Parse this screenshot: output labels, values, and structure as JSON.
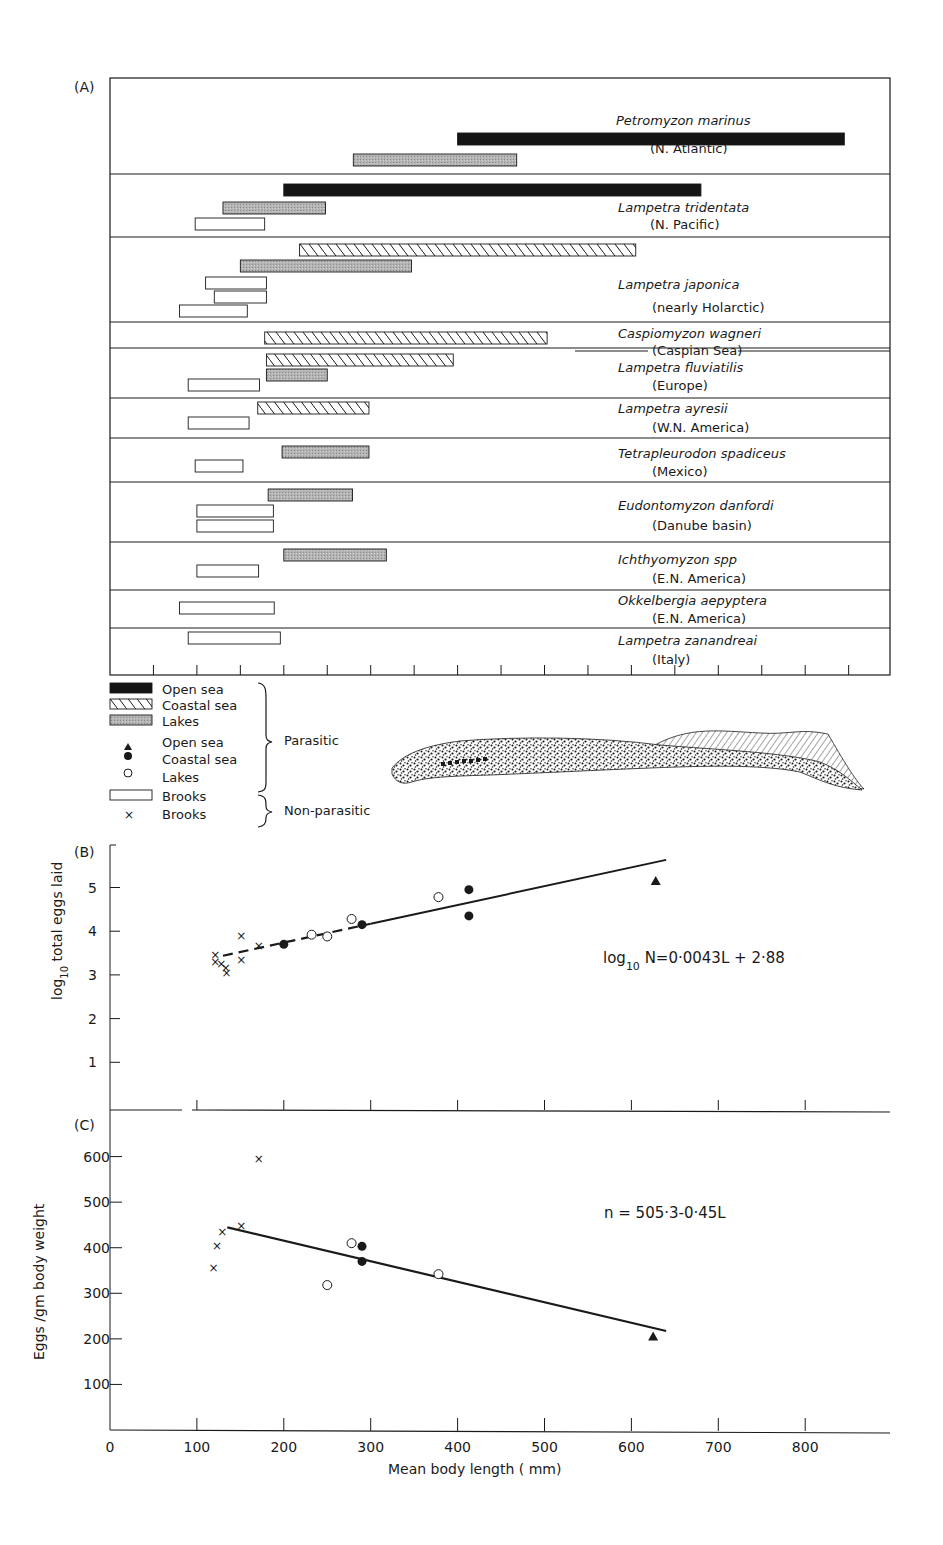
{
  "panel_a": {
    "label": "(A)",
    "species": [
      {
        "name": "Petromyzon marinus",
        "region": "(N. Atlantic)",
        "bars": [
          {
            "type": "open_sea",
            "min": 400,
            "max": 845
          },
          {
            "type": "lakes",
            "min": 280,
            "max": 468
          }
        ]
      },
      {
        "name": "Lampetra tridentata",
        "region": "(N. Pacific)",
        "bars": [
          {
            "type": "open_sea",
            "min": 200,
            "max": 680
          },
          {
            "type": "lakes",
            "min": 130,
            "max": 248
          },
          {
            "type": "brooks",
            "min": 98,
            "max": 178
          }
        ]
      },
      {
        "name": "Lampetra japonica",
        "region": "(nearly Holarctic)",
        "bars": [
          {
            "type": "coastal_sea",
            "min": 218,
            "max": 605
          },
          {
            "type": "lakes",
            "min": 150,
            "max": 347
          },
          {
            "type": "brooks",
            "min": 110,
            "max": 180
          },
          {
            "type": "brooks",
            "min": 120,
            "max": 180
          },
          {
            "type": "brooks",
            "min": 80,
            "max": 158
          }
        ]
      },
      {
        "name": "Caspiomyzon wagneri",
        "region": "(Caspian Sea)",
        "bars": [
          {
            "type": "coastal_sea",
            "min": 178,
            "max": 503
          }
        ]
      },
      {
        "name": "Lampetra fluviatilis",
        "region": "(Europe)",
        "bars": [
          {
            "type": "coastal_sea",
            "min": 180,
            "max": 395
          },
          {
            "type": "lakes",
            "min": 180,
            "max": 250
          },
          {
            "type": "brooks",
            "min": 90,
            "max": 172
          }
        ]
      },
      {
        "name": "Lampetra ayresii",
        "region": "(W.N. America)",
        "bars": [
          {
            "type": "coastal_sea",
            "min": 170,
            "max": 298
          },
          {
            "type": "brooks",
            "min": 90,
            "max": 160
          }
        ]
      },
      {
        "name": "Tetrapleurodon spadiceus",
        "region": "(Mexico)",
        "bars": [
          {
            "type": "lakes",
            "min": 198,
            "max": 298
          },
          {
            "type": "brooks",
            "min": 98,
            "max": 153
          }
        ]
      },
      {
        "name": "Eudontomyzon danfordi",
        "region": "(Danube basin)",
        "bars": [
          {
            "type": "lakes",
            "min": 182,
            "max": 279
          },
          {
            "type": "brooks",
            "min": 100,
            "max": 188
          },
          {
            "type": "brooks",
            "min": 100,
            "max": 188
          }
        ]
      },
      {
        "name": "Ichthyomyzon spp",
        "region": "(E.N. America)",
        "bars": [
          {
            "type": "lakes",
            "min": 200,
            "max": 318
          },
          {
            "type": "brooks",
            "min": 100,
            "max": 171
          }
        ]
      },
      {
        "name": "Okkelbergia aepyptera",
        "region": "(E.N. America)",
        "bars": [
          {
            "type": "brooks",
            "min": 80,
            "max": 189
          }
        ]
      },
      {
        "name": "Lampetra zanandreai",
        "region": "(Italy)",
        "bars": [
          {
            "type": "brooks",
            "min": 90,
            "max": 196
          }
        ]
      }
    ]
  },
  "legend": {
    "items": [
      {
        "symbol": "bar-open-sea",
        "label": "Open sea"
      },
      {
        "symbol": "bar-coastal-sea",
        "label": "Coastal sea"
      },
      {
        "symbol": "bar-lakes",
        "label": "Lakes"
      },
      {
        "symbol": "triangle",
        "label": "Open sea"
      },
      {
        "symbol": "filled-circle",
        "label": "Coastal sea"
      },
      {
        "symbol": "open-circle",
        "label": "Lakes"
      },
      {
        "symbol": "bar-brooks",
        "label": "Brooks"
      },
      {
        "symbol": "cross",
        "label": "Brooks"
      }
    ],
    "group_parasitic": "Parasitic",
    "group_non_parasitic": "Non-parasitic"
  },
  "colors": {
    "ink": "#1a1a1a",
    "lakes_fill": "#a8a8a8",
    "open_sea_fill": "#141414"
  },
  "chart_data": [
    {
      "type": "bar",
      "title": "(A)",
      "subtype": "horizontal range bars (body length ranges by habitat)",
      "xlabel": "Mean body length (mm)",
      "xlim": [
        0,
        900
      ],
      "x_tick_interval": 50,
      "categories": [
        "Petromyzon marinus",
        "Lampetra tridentata",
        "Lampetra japonica",
        "Caspiomyzon wagneri",
        "Lampetra fluviatilis",
        "Lampetra ayresii",
        "Tetrapleurodon spadiceus",
        "Eudontomyzon danfordi",
        "Ichthyomyzon spp",
        "Okkelbergia aepyptera",
        "Lampetra zanandreai"
      ],
      "legend": [
        "Open sea",
        "Coastal sea",
        "Lakes",
        "Brooks"
      ]
    },
    {
      "type": "scatter",
      "title": "(B)",
      "xlabel": "Mean body length (mm)",
      "ylabel": "log10 total eggs laid",
      "xlim": [
        0,
        900
      ],
      "ylim": [
        0,
        5.6
      ],
      "yticks": [
        1,
        2,
        3,
        4,
        5
      ],
      "annotation": "log10 N=0·0043L + 2·88",
      "fit_line": {
        "slope": 0.0043,
        "intercept": 2.88,
        "x_range": [
          130,
          640
        ]
      },
      "series": [
        {
          "name": "Brooks (non-parasitic)",
          "marker": "x",
          "points": [
            [
              120,
              3.45
            ],
            [
              120,
              3.3
            ],
            [
              127,
              3.25
            ],
            [
              132,
              3.15
            ],
            [
              133,
              3.05
            ],
            [
              150,
              3.9
            ],
            [
              150,
              3.35
            ],
            [
              170,
              3.65
            ]
          ]
        },
        {
          "name": "Coastal sea",
          "marker": "filled-circle",
          "points": [
            [
              200,
              3.7
            ],
            [
              290,
              4.15
            ],
            [
              413,
              4.95
            ],
            [
              413,
              4.35
            ]
          ]
        },
        {
          "name": "Lakes",
          "marker": "open-circle",
          "points": [
            [
              232,
              3.92
            ],
            [
              250,
              3.88
            ],
            [
              278,
              4.28
            ],
            [
              378,
              4.78
            ]
          ]
        },
        {
          "name": "Open sea",
          "marker": "triangle",
          "points": [
            [
              628,
              5.15
            ]
          ]
        }
      ]
    },
    {
      "type": "scatter",
      "title": "(C)",
      "xlabel": "Mean body length (mm)",
      "ylabel": "Eggs /gm body weight",
      "xlim": [
        0,
        900
      ],
      "ylim": [
        0,
        650
      ],
      "xticks": [
        0,
        100,
        200,
        300,
        400,
        500,
        600,
        700,
        800
      ],
      "yticks": [
        100,
        200,
        300,
        400,
        500,
        600
      ],
      "annotation": "n = 505·3-0·45L",
      "fit_line": {
        "slope": -0.45,
        "intercept": 505.3,
        "x_range": [
          135,
          640
        ]
      },
      "series": [
        {
          "name": "Brooks (non-parasitic)",
          "marker": "x",
          "points": [
            [
              118,
              355
            ],
            [
              122,
              403
            ],
            [
              128,
              435
            ],
            [
              150,
              447
            ],
            [
              170,
              595
            ]
          ]
        },
        {
          "name": "Lakes",
          "marker": "open-circle",
          "points": [
            [
              250,
              318
            ],
            [
              278,
              410
            ],
            [
              378,
              342
            ]
          ]
        },
        {
          "name": "Coastal sea",
          "marker": "filled-circle",
          "points": [
            [
              290,
              403
            ],
            [
              290,
              370
            ]
          ]
        },
        {
          "name": "Open sea",
          "marker": "triangle",
          "points": [
            [
              625,
              205
            ]
          ]
        }
      ]
    }
  ],
  "panel_b": {
    "label": "(B)",
    "ylabel": "log",
    "ylabel_sub": "10",
    "ylabel_rest": " total eggs laid",
    "yticks": [
      "1",
      "2",
      "3",
      "4",
      "5"
    ],
    "equation_prefix": "log",
    "equation_sub": "10",
    "equation_rest": " N=0·0043L + 2·88"
  },
  "panel_c": {
    "label": "(C)",
    "ylabel": "Eggs /gm body weight",
    "yticks": [
      "100",
      "200",
      "300",
      "400",
      "500",
      "600"
    ],
    "xticks": [
      "0",
      "100",
      "200",
      "300",
      "400",
      "500",
      "600",
      "700",
      "800"
    ],
    "xlabel": "Mean body length ( mm)",
    "equation": "n = 505·3-0·45L"
  }
}
